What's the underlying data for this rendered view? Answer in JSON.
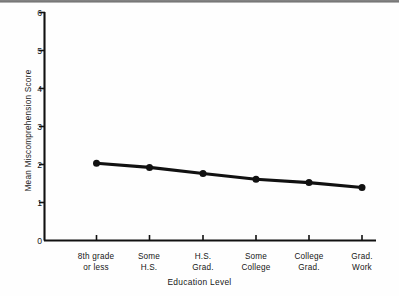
{
  "chart_data": {
    "type": "line",
    "title": "",
    "xlabel": "Education Level",
    "ylabel": "Mean Miscomprehension Score",
    "categories": [
      "8th grade\nor less",
      "Some\nH.S.",
      "H.S.\nGrad.",
      "Some\nCollege",
      "College\nGrad.",
      "Grad.\nWork"
    ],
    "category_lines": [
      [
        "8th grade",
        "or less"
      ],
      [
        "Some",
        "H.S."
      ],
      [
        "H.S.",
        "Grad."
      ],
      [
        "Some",
        "College"
      ],
      [
        "College",
        "Grad."
      ],
      [
        "Grad.",
        "Work"
      ]
    ],
    "values": [
      2.03,
      1.92,
      1.76,
      1.61,
      1.52,
      1.39
    ],
    "ylim": [
      0,
      6
    ],
    "yticks": [
      0,
      1,
      2,
      3,
      4,
      5,
      6
    ],
    "ytick_labels": [
      "0",
      "1",
      "2",
      "3",
      "4",
      "5",
      "6"
    ],
    "grid": false,
    "legend": null,
    "line_color": "#111111",
    "marker": "circle",
    "marker_color": "#111111"
  },
  "axis": {
    "y_label": "Mean Miscomprehension Score",
    "x_label": "Education Level",
    "y_ticks": [
      "6",
      "5",
      "4",
      "3",
      "2",
      "1",
      "0"
    ]
  }
}
